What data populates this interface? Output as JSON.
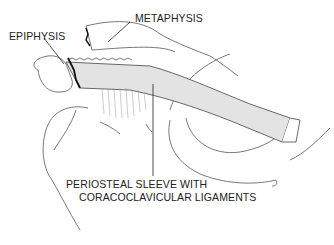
{
  "diagram": {
    "labels": {
      "metaphysis": "METAPHYSIS",
      "epiphysis": "EPIPHYSIS",
      "periosteal_line1": "PERIOSTEAL SLEEVE WITH",
      "periosteal_line2": "CORACOCLAVICULAR LIGAMENTS"
    },
    "colors": {
      "line": "#333333",
      "shade": "#d8d8d8",
      "physis": "#111111"
    }
  }
}
